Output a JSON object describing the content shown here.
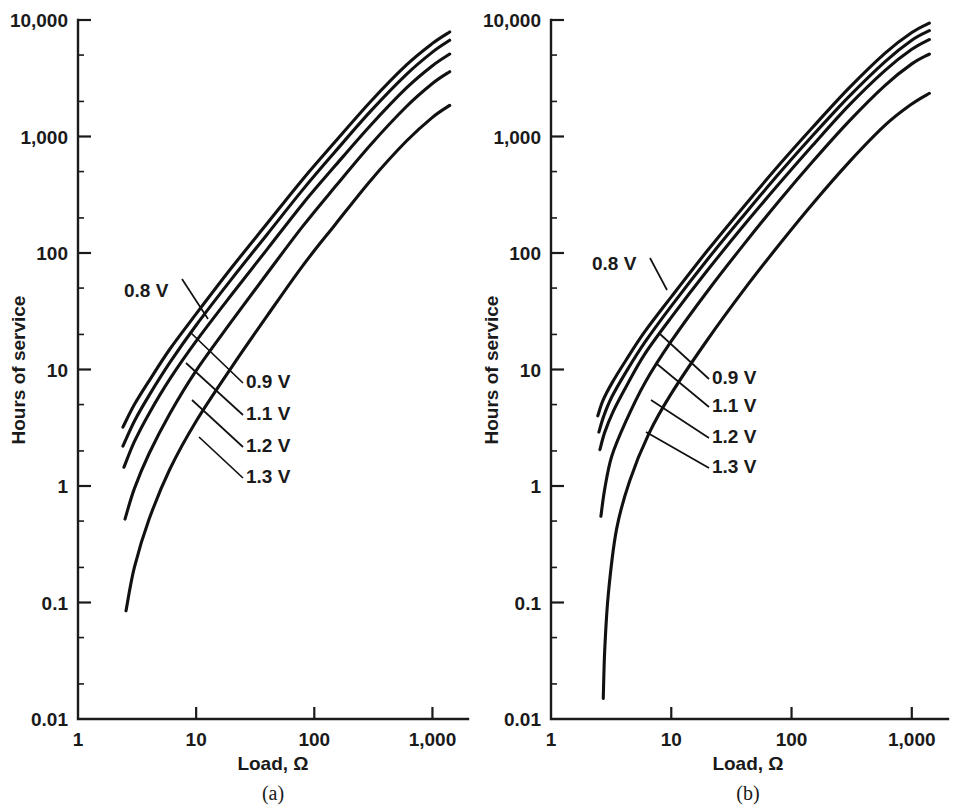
{
  "figure": {
    "background_color": "#ffffff",
    "ink_color": "#111111"
  },
  "chart_data": [
    {
      "type": "line",
      "panel": "a",
      "caption": "(a)",
      "title": "",
      "xlabel": "Load, Ω",
      "ylabel": "Hours of service",
      "xscale": "log",
      "yscale": "log",
      "xlim": [
        1,
        2000
      ],
      "ylim": [
        0.01,
        10000
      ],
      "xticks": [
        1,
        10,
        100,
        1000
      ],
      "xtick_labels": [
        "1",
        "10",
        "100",
        "1,000"
      ],
      "yticks": [
        0.01,
        0.1,
        1,
        10,
        100,
        1000,
        10000
      ],
      "ytick_labels": [
        "0.01",
        "0.1",
        "1",
        "10",
        "100",
        "1,000",
        "10,000"
      ],
      "grid": false,
      "legend": "inline-annotations",
      "series": [
        {
          "name": "0.8 V",
          "label": "0.8 V",
          "x": [
            2.4,
            3.0,
            4.0,
            6.0,
            10.0,
            20.0,
            40.0,
            80.0,
            150.0,
            300.0,
            600.0,
            1000.0,
            1400.0
          ],
          "y": [
            3.2,
            5.0,
            8.0,
            15.0,
            30.0,
            75.0,
            180.0,
            430.0,
            900.0,
            2000.0,
            4100.0,
            6300.0,
            7900.0
          ]
        },
        {
          "name": "0.9 V",
          "label": "0.9 V",
          "x": [
            2.4,
            3.0,
            4.0,
            6.0,
            10.0,
            20.0,
            40.0,
            80.0,
            150.0,
            300.0,
            600.0,
            1000.0,
            1400.0
          ],
          "y": [
            2.2,
            3.6,
            6.0,
            11.5,
            24.0,
            60.0,
            145.0,
            350.0,
            740.0,
            1650.0,
            3400.0,
            5300.0,
            6700.0
          ]
        },
        {
          "name": "1.1 V",
          "label": "1.1 V",
          "x": [
            2.45,
            3.0,
            4.0,
            6.0,
            10.0,
            20.0,
            40.0,
            80.0,
            150.0,
            300.0,
            600.0,
            1000.0,
            1400.0
          ],
          "y": [
            1.45,
            2.4,
            4.2,
            8.3,
            17.5,
            44.0,
            108.0,
            265.0,
            560.0,
            1250.0,
            2600.0,
            4050.0,
            5100.0
          ]
        },
        {
          "name": "1.2 V",
          "label": "1.2 V",
          "x": [
            2.5,
            3.0,
            4.0,
            6.0,
            10.0,
            20.0,
            40.0,
            80.0,
            150.0,
            300.0,
            600.0,
            1000.0,
            1400.0
          ],
          "y": [
            0.52,
            0.95,
            1.9,
            4.2,
            9.8,
            26.0,
            67.0,
            170.0,
            370.0,
            850.0,
            1800.0,
            2850.0,
            3600.0
          ]
        },
        {
          "name": "1.3 V",
          "label": "1.3 V",
          "x": [
            2.55,
            3.0,
            4.0,
            6.0,
            10.0,
            20.0,
            40.0,
            80.0,
            150.0,
            300.0,
            600.0,
            1000.0,
            1400.0
          ],
          "y": [
            0.085,
            0.2,
            0.52,
            1.4,
            3.6,
            10.5,
            29.0,
            78.0,
            175.0,
            420.0,
            910.0,
            1460.0,
            1850.0
          ]
        }
      ],
      "annotations": [
        {
          "text": "0.8 V",
          "anchor_curve": "0.8 V"
        },
        {
          "text": "0.9 V",
          "anchor_curve": "0.9 V"
        },
        {
          "text": "1.1 V",
          "anchor_curve": "1.1 V"
        },
        {
          "text": "1.2 V",
          "anchor_curve": "1.2 V"
        },
        {
          "text": "1.3 V",
          "anchor_curve": "1.3 V"
        }
      ]
    },
    {
      "type": "line",
      "panel": "b",
      "caption": "(b)",
      "title": "",
      "xlabel": "Load, Ω",
      "ylabel": "Hours of service",
      "xscale": "log",
      "yscale": "log",
      "xlim": [
        1,
        2000
      ],
      "ylim": [
        0.01,
        10000
      ],
      "xticks": [
        1,
        10,
        100,
        1000
      ],
      "xtick_labels": [
        "1",
        "10",
        "100",
        "1,000"
      ],
      "yticks": [
        0.01,
        0.1,
        1,
        10,
        100,
        1000,
        10000
      ],
      "ytick_labels": [
        "0.01",
        "0.1",
        "1",
        "10",
        "100",
        "1,000",
        "10,000"
      ],
      "grid": false,
      "legend": "inline-annotations",
      "series": [
        {
          "name": "0.8 V",
          "label": "0.8 V",
          "x": [
            2.45,
            2.7,
            3.2,
            4.2,
            6.0,
            10.0,
            20.0,
            40.0,
            80.0,
            150.0,
            300.0,
            600.0,
            1000.0,
            1400.0
          ],
          "y": [
            4.0,
            5.4,
            7.6,
            12.0,
            21.0,
            42.0,
            105.0,
            250.0,
            580.0,
            1200.0,
            2600.0,
            5200.0,
            7800.0,
            9400.0
          ]
        },
        {
          "name": "0.9 V",
          "label": "0.9 V",
          "x": [
            2.5,
            2.75,
            3.2,
            4.2,
            6.0,
            10.0,
            20.0,
            40.0,
            80.0,
            150.0,
            300.0,
            600.0,
            1000.0,
            1400.0
          ],
          "y": [
            2.9,
            4.0,
            5.8,
            9.5,
            17.0,
            35.0,
            88.0,
            210.0,
            490.0,
            1020.0,
            2200.0,
            4400.0,
            6700.0,
            8100.0
          ]
        },
        {
          "name": "1.1 V",
          "label": "1.1 V",
          "x": [
            2.55,
            2.8,
            3.3,
            4.3,
            6.0,
            10.0,
            20.0,
            40.0,
            80.0,
            150.0,
            300.0,
            600.0,
            1000.0,
            1400.0
          ],
          "y": [
            2.05,
            2.9,
            4.4,
            7.4,
            13.5,
            28.0,
            71.0,
            172.0,
            400.0,
            840.0,
            1850.0,
            3700.0,
            5600.0,
            6800.0
          ]
        },
        {
          "name": "1.2 V",
          "label": "1.2 V",
          "x": [
            2.6,
            2.8,
            3.2,
            4.2,
            6.0,
            10.0,
            20.0,
            40.0,
            80.0,
            150.0,
            300.0,
            600.0,
            1000.0,
            1400.0
          ],
          "y": [
            0.55,
            0.95,
            1.8,
            3.6,
            7.6,
            17.5,
            47.0,
            118.0,
            285.0,
            610.0,
            1350.0,
            2750.0,
            4200.0,
            5100.0
          ]
        },
        {
          "name": "1.3 V",
          "label": "1.3 V",
          "x": [
            2.72,
            2.8,
            3.0,
            3.5,
            4.5,
            6.5,
            10.0,
            20.0,
            40.0,
            80.0,
            150.0,
            300.0,
            600.0,
            1000.0,
            1400.0
          ],
          "y": [
            0.015,
            0.04,
            0.12,
            0.42,
            1.1,
            2.8,
            6.2,
            18.0,
            48.0,
            120.0,
            265.0,
            600.0,
            1250.0,
            1900.0,
            2350.0
          ]
        }
      ],
      "annotations": [
        {
          "text": "0.8 V",
          "anchor_curve": "0.8 V"
        },
        {
          "text": "0.9 V",
          "anchor_curve": "0.9 V"
        },
        {
          "text": "1.1 V",
          "anchor_curve": "1.1 V"
        },
        {
          "text": "1.2 V",
          "anchor_curve": "1.2 V"
        },
        {
          "text": "1.3 V",
          "anchor_curve": "1.3 V"
        }
      ]
    }
  ]
}
